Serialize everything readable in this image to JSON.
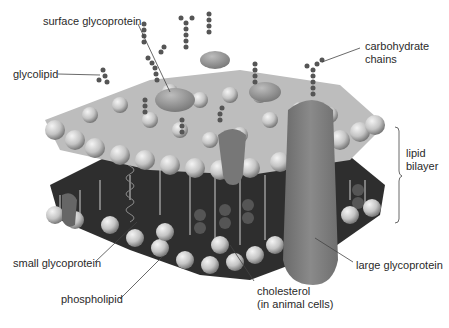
{
  "diagram": {
    "labels": {
      "surface_glycoprotein": "surface glycoprotein",
      "glycolipid": "glycolipid",
      "carbohydrate_chains_1": "carbohydrate",
      "carbohydrate_chains_2": "chains",
      "lipid_bilayer_1": "lipid",
      "lipid_bilayer_2": "bilayer",
      "small_glycoprotein": "small glycoprotein",
      "phospholipid": "phospholipid",
      "cholesterol_1": "cholesterol",
      "cholesterol_2": "(in animal cells)",
      "large_glycoprotein": "large glycoprotein"
    },
    "colors": {
      "head": "#d8d8d8",
      "head_shade": "#8a8a8a",
      "protein": "#7d7d7d",
      "interior": "#2e2e2e",
      "line": "#444444"
    }
  }
}
